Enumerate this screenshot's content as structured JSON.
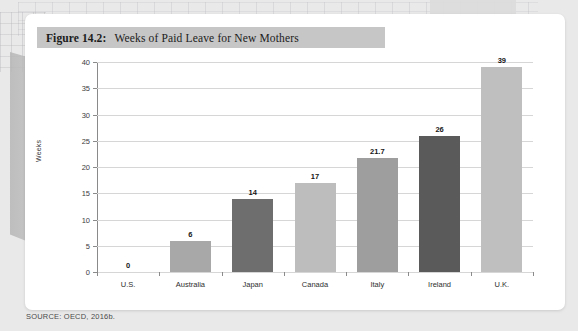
{
  "figure": {
    "number": "Figure 14.2:",
    "title": "Weeks of Paid Leave for New Mothers"
  },
  "source": "SOURCE: OECD, 2016b.",
  "chart_data": {
    "type": "bar",
    "title": "Weeks of Paid Leave for New Mothers",
    "xlabel": "",
    "ylabel": "Weeks",
    "categories": [
      "U.S.",
      "Australia",
      "Japan",
      "Canada",
      "Italy",
      "Ireland",
      "U.K."
    ],
    "values": [
      0,
      6,
      14,
      17,
      21.7,
      26,
      39
    ],
    "value_labels": [
      "0",
      "6",
      "14",
      "17",
      "21.7",
      "26",
      "39"
    ],
    "bar_colors": [
      "#ffffff",
      "#a8a8a8",
      "#6e6e6e",
      "#bdbdbd",
      "#9e9e9e",
      "#5a5a5a",
      "#bfbfbf"
    ],
    "ylim": [
      0,
      40
    ],
    "yticks": [
      0,
      5,
      10,
      15,
      20,
      25,
      30,
      35,
      40
    ],
    "ytick_labels": [
      "0",
      "5",
      "10",
      "15",
      "20",
      "25",
      "30",
      "35",
      "40"
    ],
    "grid": true,
    "legend": "none"
  }
}
